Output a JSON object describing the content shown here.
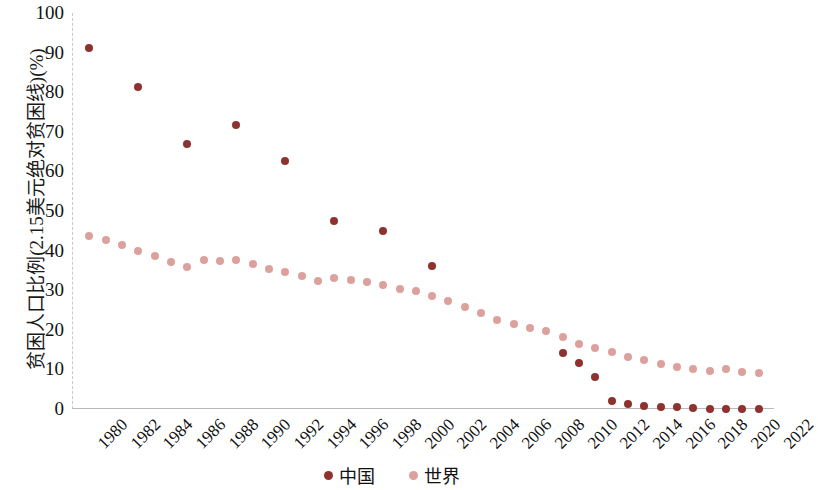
{
  "chart_data": {
    "type": "scatter",
    "title": "",
    "xlabel": "",
    "ylabel": "贫困人口比例(2.15美元绝对贫困线)(%)",
    "xlim": [
      1980,
      2023
    ],
    "ylim": [
      0,
      100
    ],
    "ytick_labels": [
      "0",
      "10",
      "20",
      "30",
      "40",
      "50",
      "60",
      "70",
      "80",
      "90",
      "100"
    ],
    "ytick_values": [
      0,
      10,
      20,
      30,
      40,
      50,
      60,
      70,
      80,
      90,
      100
    ],
    "xtick_labels": [
      "1980",
      "1982",
      "1984",
      "1986",
      "1988",
      "1990",
      "1992",
      "1994",
      "1996",
      "1998",
      "2000",
      "2002",
      "2004",
      "2006",
      "2008",
      "2010",
      "2012",
      "2014",
      "2016",
      "2018",
      "2020",
      "2022"
    ],
    "xtick_values": [
      1980,
      1982,
      1984,
      1986,
      1988,
      1990,
      1992,
      1994,
      1996,
      1998,
      2000,
      2002,
      2004,
      2006,
      2008,
      2010,
      2012,
      2014,
      2016,
      2018,
      2020,
      2022
    ],
    "grid": false,
    "legend_position": "bottom-center",
    "series": [
      {
        "name": "中国",
        "color": "#8e322f",
        "marker": "circle",
        "points": [
          {
            "x": 1981,
            "y": 91.2
          },
          {
            "x": 1984,
            "y": 81.2
          },
          {
            "x": 1987,
            "y": 67.0
          },
          {
            "x": 1990,
            "y": 71.8
          },
          {
            "x": 1993,
            "y": 62.6
          },
          {
            "x": 1996,
            "y": 47.5
          },
          {
            "x": 1999,
            "y": 45.0
          },
          {
            "x": 2002,
            "y": 36.0
          },
          {
            "x": 2010,
            "y": 14.2
          },
          {
            "x": 2011,
            "y": 11.5
          },
          {
            "x": 2012,
            "y": 8.0
          },
          {
            "x": 2013,
            "y": 2.0
          },
          {
            "x": 2014,
            "y": 1.2
          },
          {
            "x": 2015,
            "y": 0.7
          },
          {
            "x": 2016,
            "y": 0.6
          },
          {
            "x": 2017,
            "y": 0.5
          },
          {
            "x": 2018,
            "y": 0.3
          },
          {
            "x": 2019,
            "y": 0.1
          },
          {
            "x": 2020,
            "y": 0.1
          },
          {
            "x": 2021,
            "y": 0.0
          },
          {
            "x": 2022,
            "y": 0.0
          }
        ]
      },
      {
        "name": "世界",
        "color": "#dda19d",
        "marker": "circle",
        "points": [
          {
            "x": 1981,
            "y": 43.6
          },
          {
            "x": 1982,
            "y": 42.8
          },
          {
            "x": 1983,
            "y": 41.5
          },
          {
            "x": 1984,
            "y": 40.0
          },
          {
            "x": 1985,
            "y": 38.7
          },
          {
            "x": 1986,
            "y": 37.1
          },
          {
            "x": 1987,
            "y": 35.8
          },
          {
            "x": 1988,
            "y": 37.6
          },
          {
            "x": 1989,
            "y": 37.3
          },
          {
            "x": 1990,
            "y": 37.6
          },
          {
            "x": 1991,
            "y": 36.5
          },
          {
            "x": 1992,
            "y": 35.3
          },
          {
            "x": 1993,
            "y": 34.6
          },
          {
            "x": 1994,
            "y": 33.6
          },
          {
            "x": 1995,
            "y": 32.3
          },
          {
            "x": 1996,
            "y": 33.1
          },
          {
            "x": 1997,
            "y": 32.5
          },
          {
            "x": 1998,
            "y": 32.0
          },
          {
            "x": 1999,
            "y": 31.3
          },
          {
            "x": 2000,
            "y": 30.3
          },
          {
            "x": 2001,
            "y": 29.7
          },
          {
            "x": 2002,
            "y": 28.6
          },
          {
            "x": 2003,
            "y": 27.2
          },
          {
            "x": 2004,
            "y": 25.7
          },
          {
            "x": 2005,
            "y": 24.2
          },
          {
            "x": 2006,
            "y": 22.6
          },
          {
            "x": 2007,
            "y": 21.5
          },
          {
            "x": 2008,
            "y": 20.4
          },
          {
            "x": 2009,
            "y": 19.6
          },
          {
            "x": 2010,
            "y": 18.2
          },
          {
            "x": 2011,
            "y": 16.4
          },
          {
            "x": 2012,
            "y": 15.4
          },
          {
            "x": 2013,
            "y": 14.4
          },
          {
            "x": 2014,
            "y": 13.1
          },
          {
            "x": 2015,
            "y": 12.3
          },
          {
            "x": 2016,
            "y": 11.4
          },
          {
            "x": 2017,
            "y": 10.6
          },
          {
            "x": 2018,
            "y": 10.1
          },
          {
            "x": 2019,
            "y": 9.6
          },
          {
            "x": 2020,
            "y": 10.0
          },
          {
            "x": 2021,
            "y": 9.3
          },
          {
            "x": 2022,
            "y": 9.0
          }
        ]
      }
    ]
  },
  "legend": {
    "items": [
      {
        "label": "中国",
        "color": "#8e322f"
      },
      {
        "label": "世界",
        "color": "#dda19d"
      }
    ]
  }
}
